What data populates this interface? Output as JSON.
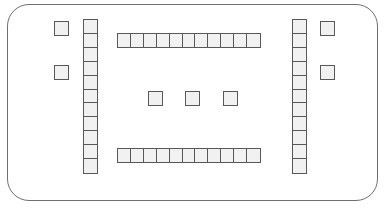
{
  "canvas": {
    "width": 386,
    "height": 208,
    "background": "#ffffff"
  },
  "frame": {
    "name": "rounded-boundary",
    "x": 7,
    "y": 4,
    "width": 371,
    "height": 197,
    "corner_radius": 22,
    "stroke_color": "#6f6f6f",
    "stroke_width": 1.2,
    "fill": "none"
  },
  "style": {
    "cell_fill": "#f1f1f1",
    "cell_stroke": "#585858",
    "cell_stroke_width": 1.6
  },
  "groups": [
    {
      "id": "left-marker-upper",
      "name": "isolated-square-left-upper",
      "kind": "single",
      "orientation": "none",
      "count": 1,
      "x": 54,
      "y": 21,
      "cell_width": 15,
      "cell_height": 15
    },
    {
      "id": "left-marker-lower",
      "name": "isolated-square-left-lower",
      "kind": "single",
      "orientation": "none",
      "count": 1,
      "x": 54,
      "y": 65,
      "cell_width": 15,
      "cell_height": 15
    },
    {
      "id": "left-column",
      "name": "vertical-bar-left",
      "kind": "bar",
      "orientation": "vertical",
      "count": 11,
      "x": 83,
      "y": 19,
      "cell_width": 15,
      "cell_height": 15.5
    },
    {
      "id": "top-row",
      "name": "horizontal-bar-top",
      "kind": "bar",
      "orientation": "horizontal",
      "count": 11,
      "x": 117,
      "y": 33,
      "cell_width": 14.5,
      "cell_height": 15
    },
    {
      "id": "center-square-left",
      "name": "isolated-square-center-left",
      "kind": "single",
      "orientation": "none",
      "count": 1,
      "x": 148,
      "y": 91,
      "cell_width": 15,
      "cell_height": 15
    },
    {
      "id": "center-square-middle",
      "name": "isolated-square-center-middle",
      "kind": "single",
      "orientation": "none",
      "count": 1,
      "x": 185,
      "y": 91,
      "cell_width": 15,
      "cell_height": 15
    },
    {
      "id": "center-square-right",
      "name": "isolated-square-center-right",
      "kind": "single",
      "orientation": "none",
      "count": 1,
      "x": 223,
      "y": 91,
      "cell_width": 15,
      "cell_height": 15
    },
    {
      "id": "bottom-row",
      "name": "horizontal-bar-bottom",
      "kind": "bar",
      "orientation": "horizontal",
      "count": 11,
      "x": 117,
      "y": 148,
      "cell_width": 14.5,
      "cell_height": 15
    },
    {
      "id": "right-column",
      "name": "vertical-bar-right",
      "kind": "bar",
      "orientation": "vertical",
      "count": 11,
      "x": 292,
      "y": 19,
      "cell_width": 15,
      "cell_height": 15.5
    },
    {
      "id": "right-marker-upper",
      "name": "isolated-square-right-upper",
      "kind": "single",
      "orientation": "none",
      "count": 1,
      "x": 320,
      "y": 21,
      "cell_width": 15,
      "cell_height": 15
    },
    {
      "id": "right-marker-lower",
      "name": "isolated-square-right-lower",
      "kind": "single",
      "orientation": "none",
      "count": 1,
      "x": 320,
      "y": 65,
      "cell_width": 15,
      "cell_height": 15
    }
  ]
}
